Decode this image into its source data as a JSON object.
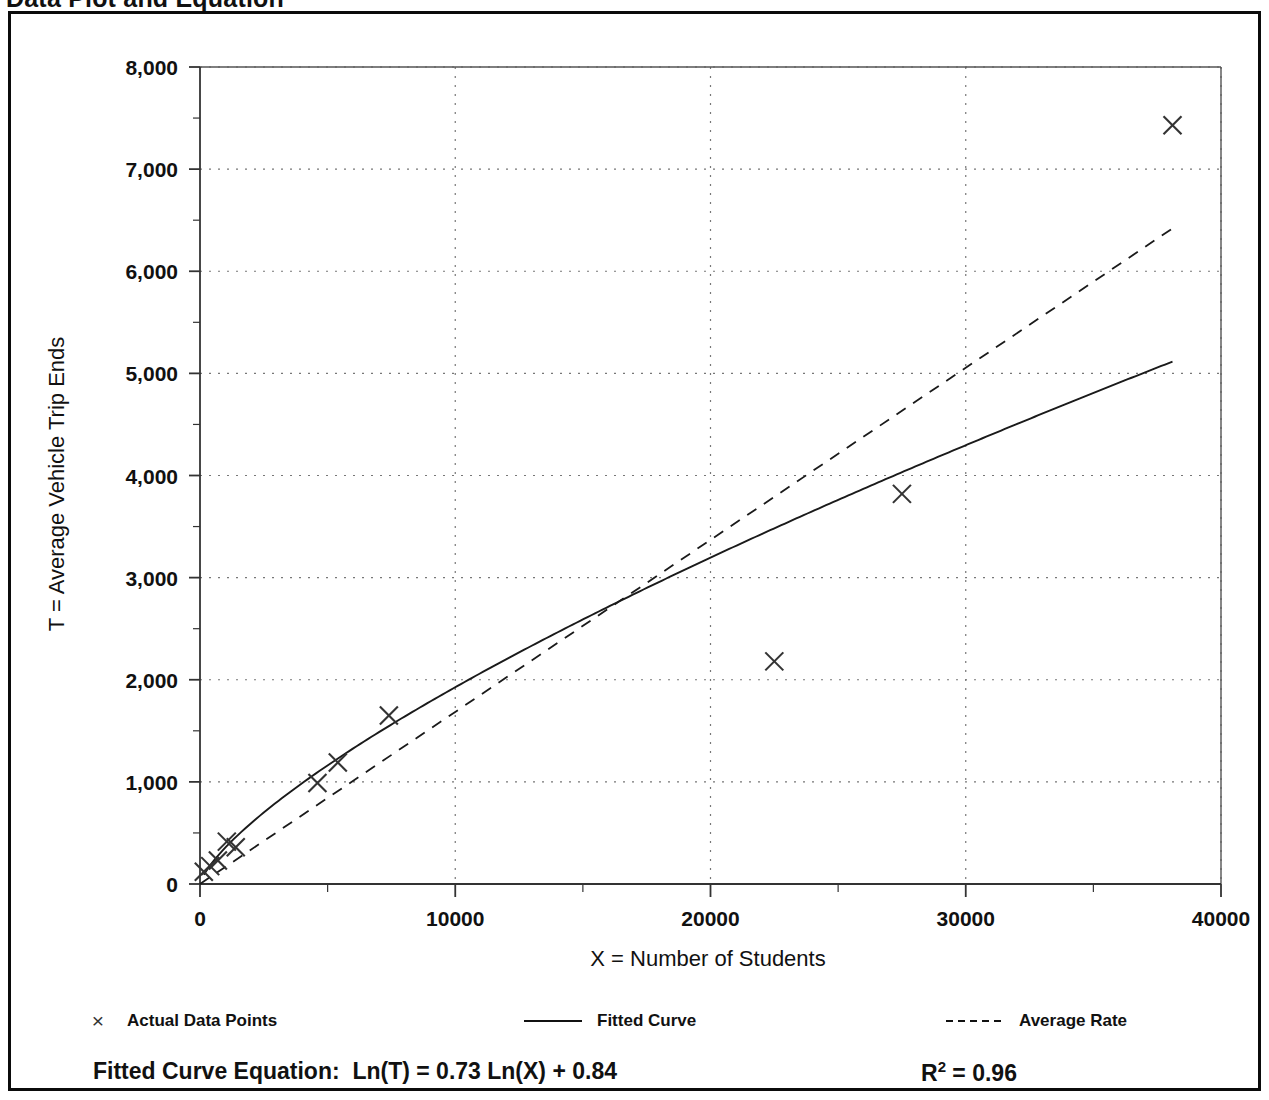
{
  "page_title": "Data Plot and Equation",
  "chart_data": {
    "type": "scatter",
    "title": "Data Plot and Equation",
    "xlabel": "X = Number of Students",
    "ylabel": "T = Average Vehicle Trip Ends",
    "xlim": [
      0,
      40000
    ],
    "ylim": [
      0,
      8000
    ],
    "grid": true,
    "x_ticks": [
      0,
      10000,
      20000,
      30000,
      40000
    ],
    "x_tick_labels": [
      "0",
      "10000",
      "20000",
      "30000",
      "40000"
    ],
    "x_minor_tick_step": 5000,
    "y_ticks": [
      0,
      1000,
      2000,
      3000,
      4000,
      5000,
      6000,
      7000,
      8000
    ],
    "y_tick_labels": [
      "0",
      "1,000",
      "2,000",
      "3,000",
      "4,000",
      "5,000",
      "6,000",
      "7,000",
      "8,000"
    ],
    "y_minor_tick_step": 500,
    "series": [
      {
        "name": "Actual Data Points",
        "type": "scatter",
        "marker": "x",
        "color": "#333333",
        "points": [
          [
            150,
            120
          ],
          [
            400,
            175
          ],
          [
            700,
            230
          ],
          [
            1050,
            415
          ],
          [
            1400,
            360
          ],
          [
            4600,
            990
          ],
          [
            5400,
            1190
          ],
          [
            7400,
            1650
          ],
          [
            22500,
            2180
          ],
          [
            27500,
            3820
          ],
          [
            38100,
            7430
          ]
        ]
      },
      {
        "name": "Fitted Curve",
        "type": "line",
        "style": "solid",
        "color": "#1a1a1a",
        "equation": "Ln(T) = 0.73 Ln(X) + 0.84",
        "a": 0.84,
        "b": 0.73,
        "x_start": 150,
        "x_end": 38100
      },
      {
        "name": "Average Rate",
        "type": "line",
        "style": "dashed",
        "color": "#1a1a1a",
        "slope": 0.1685,
        "x_start": 0,
        "x_end": 38100
      }
    ],
    "annotations": {
      "equation_label": "Fitted Curve Equation:",
      "equation_body": "Ln(T) = 0.73 Ln(X) + 0.84",
      "r2_label": "R",
      "r2_sup": "2",
      "r2_value": " = 0.96",
      "r2_full": "R2 = 0.96"
    },
    "legend_position": "below"
  },
  "legend": {
    "entries": [
      {
        "label": "Actual Data Points",
        "swatch": "x-marker",
        "glyph": "×"
      },
      {
        "label": "Fitted Curve",
        "swatch": "solid-line"
      },
      {
        "label": "Average Rate",
        "swatch": "dashed-line"
      }
    ]
  },
  "equation": {
    "label": "Fitted Curve Equation:",
    "body": "Ln(T) = 0.73 Ln(X) + 0.84",
    "r2_base": "R",
    "r2_exp": "2",
    "r2_rest": " = 0.96"
  }
}
